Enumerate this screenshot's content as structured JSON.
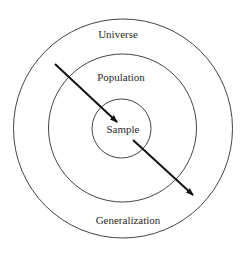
{
  "diagram": {
    "type": "concentric-circles",
    "colors": {
      "background": "#ffffff",
      "stroke": "#444444",
      "arrow": "#111111",
      "text": "#2a2a2a"
    },
    "circles": [
      {
        "name": "universe",
        "label": "Universe",
        "cx": 123,
        "cy": 128.5,
        "r": 109.5,
        "label_x": 118,
        "label_y": 38
      },
      {
        "name": "population",
        "label": "Population",
        "cx": 122.5,
        "cy": 128,
        "r": 74,
        "label_x": 121,
        "label_y": 81
      },
      {
        "name": "sample",
        "label": "Sample",
        "cx": 121.5,
        "cy": 128.5,
        "r": 29.5,
        "label_x": 123,
        "label_y": 133
      }
    ],
    "bottom_label": {
      "label": "Generalization",
      "x": 128,
      "y": 224
    },
    "arrows": [
      {
        "name": "sampling-arrow",
        "x1": 55,
        "y1": 64,
        "x2": 117,
        "y2": 122
      },
      {
        "name": "generalization-arrow",
        "x1": 133,
        "y1": 140,
        "x2": 193,
        "y2": 195
      }
    ]
  }
}
